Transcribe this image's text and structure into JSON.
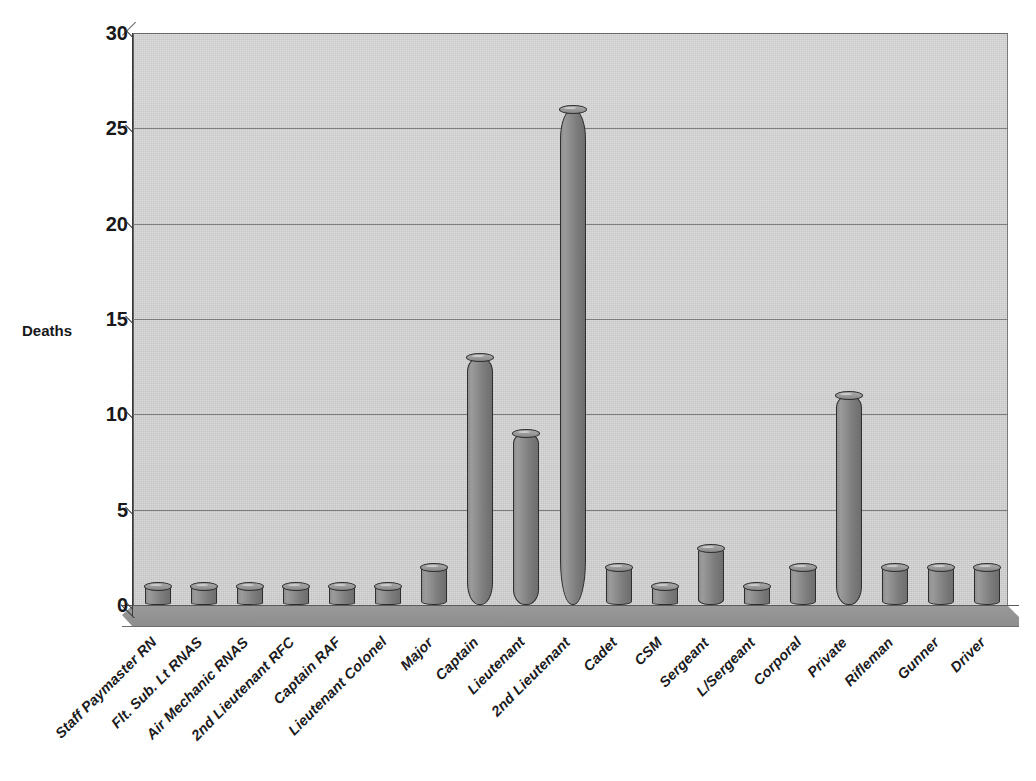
{
  "chart_data": {
    "type": "bar",
    "title": "",
    "subtitle": "",
    "xlabel": "",
    "ylabel": "Deaths",
    "ylim": [
      0,
      30
    ],
    "yticks": [
      0,
      5,
      10,
      15,
      20,
      25,
      30
    ],
    "grid": true,
    "legend": false,
    "style": "3d-cylinder-bars",
    "categories": [
      "Staff Paymaster RN",
      "Flt. Sub. Lt RNAS",
      "Air Mechanic RNAS",
      "2nd Lieutenant RFC",
      "Captain RAF",
      "Lieutenant Colonel",
      "Major",
      "Captain",
      "Lieutenant",
      "2nd Lieutenant",
      "Cadet",
      "CSM",
      "Sergeant",
      "L/Sergeant",
      "Corporal",
      "Private",
      "Rifleman",
      "Gunner",
      "Driver"
    ],
    "values": [
      1,
      1,
      1,
      1,
      1,
      1,
      2,
      13,
      9,
      26,
      2,
      1,
      3,
      1,
      2,
      11,
      2,
      2,
      2
    ]
  },
  "axis": {
    "y_title": "Deaths",
    "y_tick_labels": [
      "0",
      "5",
      "10",
      "15",
      "20",
      "25",
      "30"
    ]
  },
  "colors": {
    "plot_background": "#c6c6c6",
    "floor": "#929292",
    "bar_fill": "#8a8a8a",
    "bar_outline": "#2e2e2e",
    "gridline": "#6f6f6f",
    "text": "#18181a",
    "page_background": "#ffffff"
  }
}
